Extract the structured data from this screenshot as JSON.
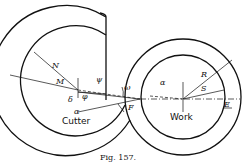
{
  "figure": {
    "caption": "Fig. 157.",
    "labels": {
      "cutter": "Cutter",
      "work": "Work",
      "N": "N",
      "M": "M",
      "psi": "ψ",
      "phi": "φ",
      "delta": "δ",
      "alpha_cutter": "α",
      "alpha_work": "α",
      "omega": "ω",
      "F": "F",
      "R": "R",
      "S": "S",
      "E": "E"
    }
  }
}
